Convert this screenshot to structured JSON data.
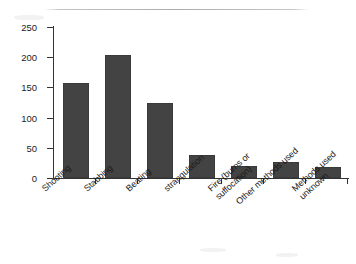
{
  "chart_data": {
    "type": "bar",
    "title": "",
    "subtitle": "",
    "xlabel": "",
    "ylabel": "",
    "ylim": [
      0,
      250
    ],
    "yticks": [
      0,
      50,
      100,
      150,
      200,
      250
    ],
    "grid": false,
    "legend": false,
    "bar_color": "#434343",
    "axis_color": "#333333",
    "background": "#ffffff",
    "categories": [
      "Shooting",
      "Stabbing",
      "Beating",
      "strangulation",
      "Fire (burns or\nsuffocation)",
      "Other methods used",
      "Methods used\nunknown"
    ],
    "values": [
      157,
      203,
      125,
      38,
      20,
      27,
      18
    ]
  },
  "yticks": {
    "t0": "0",
    "t1": "50",
    "t2": "100",
    "t3": "150",
    "t4": "200",
    "t5": "250"
  },
  "xlabels": {
    "c0": "Shooting",
    "c1": "Stabbing",
    "c2": "Beating",
    "c3": "strangulation",
    "c4": "Fire (burns or\nsuffocation)",
    "c5": "Other methods used",
    "c6": "Methods used\nunknown"
  }
}
